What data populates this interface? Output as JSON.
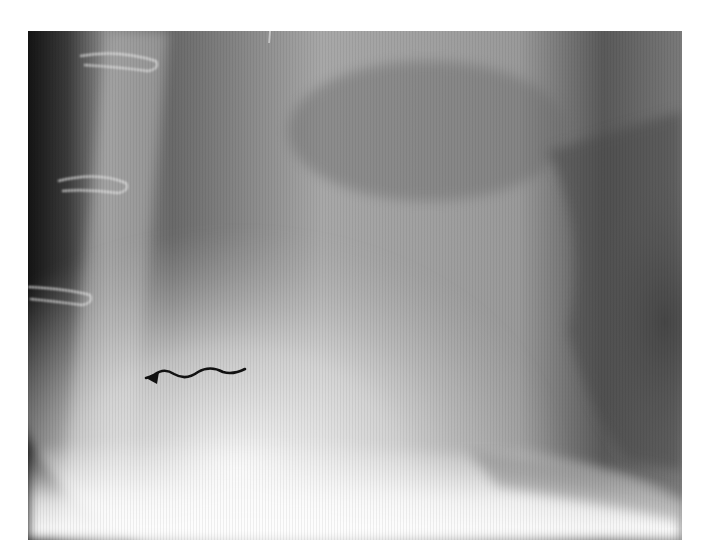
{
  "figure": {
    "kind": "lateral chest radiograph",
    "frame": {
      "x": 28,
      "y": 31,
      "width": 654,
      "height": 509
    },
    "background_color": "#ffffff",
    "annotations": [
      {
        "type": "wavy-arrow",
        "color": "#111111",
        "tail": [
          245,
          369
        ],
        "head": [
          146,
          378
        ],
        "direction": "left"
      }
    ],
    "visible_structures": [
      {
        "name": "sternum-with-wire-loops",
        "wire_loops": 3
      },
      {
        "name": "heart-silhouette"
      },
      {
        "name": "diaphragm"
      },
      {
        "name": "posterior-lung"
      }
    ]
  }
}
